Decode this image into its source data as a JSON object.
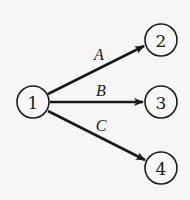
{
  "diagram": {
    "type": "directed-graph",
    "nodes": [
      {
        "id": "1",
        "label": "1",
        "cx": 33,
        "cy": 102
      },
      {
        "id": "2",
        "label": "2",
        "cx": 161,
        "cy": 40
      },
      {
        "id": "3",
        "label": "3",
        "cx": 161,
        "cy": 102
      },
      {
        "id": "4",
        "label": "4",
        "cx": 161,
        "cy": 168
      }
    ],
    "edges": [
      {
        "from": "1",
        "to": "2",
        "label": "A"
      },
      {
        "from": "1",
        "to": "3",
        "label": "B"
      },
      {
        "from": "1",
        "to": "4",
        "label": "C"
      }
    ],
    "colors": {
      "stroke": "#1a1a1a",
      "background": "#f6f6f4"
    }
  }
}
